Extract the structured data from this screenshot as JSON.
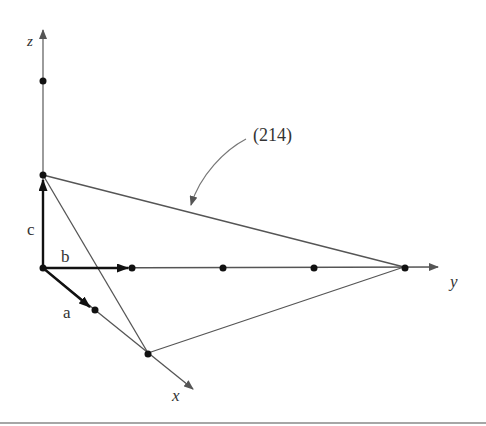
{
  "figure": {
    "plane_label": "(214)",
    "axes": {
      "x": "x",
      "y": "y",
      "z": "z"
    },
    "vectors": {
      "a": "a",
      "b": "b",
      "c": "c"
    },
    "miller_index": [
      2,
      1,
      4
    ],
    "intercepts": {
      "x": "a/2 → 1/2 unit... 2a",
      "y": "4b",
      "z": "c"
    },
    "colors": {
      "line": "#555555",
      "vector": "#111111",
      "point": "#111111"
    }
  }
}
